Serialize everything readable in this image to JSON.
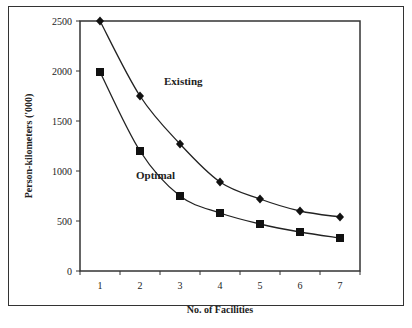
{
  "chart_data": {
    "type": "line",
    "title": "",
    "xlabel": "No. of Facilities",
    "ylabel": "Person-kilometers ('000)",
    "x": [
      1,
      2,
      3,
      4,
      5,
      6,
      7
    ],
    "ylim": [
      0,
      2500
    ],
    "yticks": [
      0,
      500,
      1000,
      1500,
      2000,
      2500
    ],
    "xticks": [
      1,
      2,
      3,
      4,
      5,
      6,
      7
    ],
    "grid": false,
    "legend_position": "inline labels",
    "series": [
      {
        "name": "Existing",
        "marker": "diamond",
        "values": [
          2500,
          1750,
          1270,
          890,
          720,
          600,
          540
        ]
      },
      {
        "name": "Optimal",
        "marker": "square",
        "values": [
          1990,
          1200,
          750,
          580,
          470,
          390,
          330
        ]
      }
    ],
    "annotations": [
      {
        "text": "Existing",
        "x": 2.6,
        "y": 1900
      },
      {
        "text": "Optimal",
        "x": 1.9,
        "y": 960
      }
    ]
  }
}
